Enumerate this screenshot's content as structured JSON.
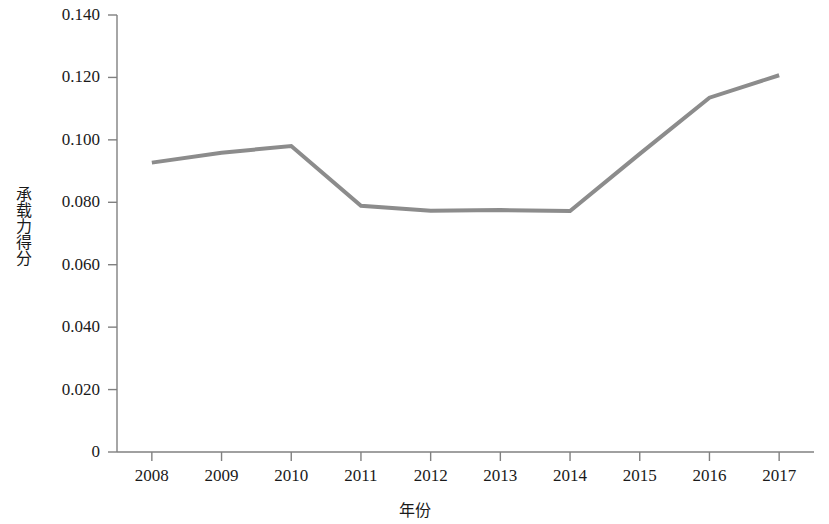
{
  "chart_data": {
    "type": "line",
    "title": "",
    "xlabel": "年份",
    "ylabel": "承载力得分",
    "categories": [
      "2008",
      "2009",
      "2010",
      "2011",
      "2012",
      "2013",
      "2014",
      "2015",
      "2016",
      "2017"
    ],
    "x": [
      2008,
      2009,
      2010,
      2011,
      2012,
      2013,
      2014,
      2015,
      2016,
      2017
    ],
    "series": [
      {
        "name": "承载力得分",
        "values": [
          0.0927,
          0.0959,
          0.098,
          0.0789,
          0.0773,
          0.0775,
          0.0772,
          0.0955,
          0.1135,
          0.1207
        ],
        "color": "#8c8c8c"
      }
    ],
    "ylim": [
      0,
      0.14
    ],
    "ytick_labels": [
      "0",
      "0.020",
      "0.040",
      "0.060",
      "0.080",
      "0.100",
      "0.120",
      "0.140"
    ],
    "ytick_values": [
      0,
      0.02,
      0.04,
      0.06,
      0.08,
      0.1,
      0.12,
      0.14
    ],
    "xlim": [
      2007.5,
      2017.5
    ],
    "grid": false,
    "legend": false,
    "legend_position": "none",
    "line_width": 4,
    "markers": false,
    "axis_color": "#808080",
    "text_color": "#1a1a1a",
    "background": "#ffffff"
  }
}
